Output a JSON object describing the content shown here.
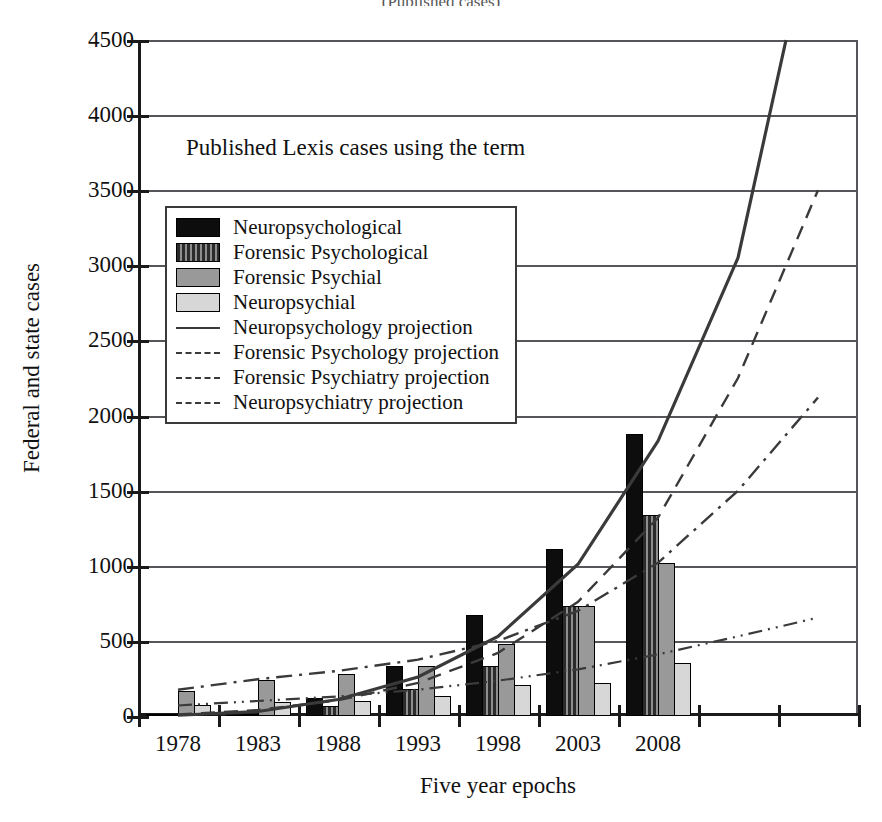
{
  "chart_data": {
    "type": "bar",
    "title": "(Published cases)",
    "annotation": "Published Lexis cases using the term",
    "xlabel": "Five year epochs",
    "ylabel": "Federal and state cases",
    "categories": [
      "1978",
      "1983",
      "1988",
      "1993",
      "1998",
      "2003",
      "2008"
    ],
    "ylim": [
      0,
      4500
    ],
    "yticks": [
      0,
      500,
      1000,
      1500,
      2000,
      2500,
      3000,
      3500,
      4000,
      4500
    ],
    "ytick_labels": [
      "0",
      "500",
      "1000",
      "1500",
      "2000",
      "2500",
      "3000",
      "3500",
      "4000",
      "4500"
    ],
    "grid": true,
    "legend_position": "upper-left-inside",
    "series": [
      {
        "name": "Neuropsychological",
        "style": "bar",
        "fill": "black",
        "values": [
          5,
          20,
          120,
          330,
          670,
          1110,
          1880
        ]
      },
      {
        "name": "Forensic Psychological",
        "style": "bar",
        "fill": "striped",
        "values": [
          8,
          15,
          70,
          180,
          335,
          735,
          1340
        ]
      },
      {
        "name": "Forensic Psychial",
        "style": "bar",
        "fill": "gray",
        "values": [
          165,
          240,
          280,
          330,
          480,
          730,
          1020
        ]
      },
      {
        "name": "Neuropsychial",
        "style": "bar",
        "fill": "light",
        "values": [
          75,
          95,
          100,
          130,
          205,
          220,
          350
        ]
      },
      {
        "name": "Neuropsychology projection",
        "style": "line",
        "dash": "solid",
        "points": [
          [
            0,
            5
          ],
          [
            1,
            30
          ],
          [
            2,
            110
          ],
          [
            3,
            260
          ],
          [
            4,
            530
          ],
          [
            5,
            1010
          ],
          [
            6,
            1830
          ],
          [
            7,
            3050
          ],
          [
            7.6,
            4500
          ]
        ]
      },
      {
        "name": "Forensic Psychology projection",
        "style": "line",
        "dash": "dashed",
        "points": [
          [
            0,
            10
          ],
          [
            1,
            40
          ],
          [
            2,
            105
          ],
          [
            3,
            220
          ],
          [
            4,
            420
          ],
          [
            5,
            760
          ],
          [
            6,
            1320
          ],
          [
            7,
            2250
          ],
          [
            8,
            3500
          ]
        ]
      },
      {
        "name": "Forensic Psychiatry projection",
        "style": "line",
        "dash": "dashdot",
        "points": [
          [
            0,
            175
          ],
          [
            1,
            245
          ],
          [
            2,
            300
          ],
          [
            3,
            375
          ],
          [
            4,
            500
          ],
          [
            5,
            700
          ],
          [
            6,
            1020
          ],
          [
            7,
            1500
          ],
          [
            8,
            2120
          ]
        ]
      },
      {
        "name": "Neuropsychiatry  projection",
        "style": "line",
        "dash": "dashdotdot",
        "points": [
          [
            0,
            70
          ],
          [
            1,
            100
          ],
          [
            2,
            130
          ],
          [
            3,
            175
          ],
          [
            4,
            235
          ],
          [
            5,
            310
          ],
          [
            6,
            410
          ],
          [
            7,
            530
          ],
          [
            8,
            655
          ]
        ]
      }
    ],
    "colors": {
      "black": "#0d0d0d",
      "striped": "#2b2b2b",
      "gray": "#999999",
      "light": "#d7d7d7",
      "grid": "#55555a",
      "axis": "#1a1a1a",
      "line": "#3a3a3a"
    }
  }
}
